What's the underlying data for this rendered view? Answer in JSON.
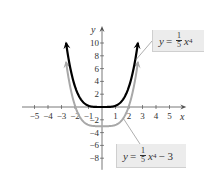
{
  "chart_data": {
    "type": "line",
    "title": "",
    "xlabel": "x",
    "ylabel": "y",
    "xlim": [
      -5.5,
      5.8
    ],
    "ylim": [
      -9.5,
      12.5
    ],
    "x_ticks": [
      -5,
      -4,
      -3,
      -2,
      -1,
      1,
      2,
      3,
      4,
      5
    ],
    "y_ticks": [
      -8,
      -6,
      -4,
      -2,
      2,
      4,
      6,
      8,
      10
    ],
    "x_tick_labels": [
      "−5",
      "−4",
      "−3",
      "−2",
      "−1",
      "1",
      "2",
      "3",
      "4",
      "5"
    ],
    "y_tick_labels": [
      "−8",
      "−6",
      "−4",
      "−2",
      "2",
      "4",
      "6",
      "8",
      "10"
    ],
    "grid": false,
    "series": [
      {
        "name": "y = (1/5)x^4",
        "formula": "0.2*x^4",
        "color": "#000000",
        "x_range": [
          -2.66,
          2.66
        ],
        "endpoints_arrow": true
      },
      {
        "name": "y = (1/5)x^4 − 3",
        "formula": "0.2*x^4 - 3",
        "color": "#a8a8a8",
        "x_range": [
          -2.66,
          2.66
        ],
        "endpoints_arrow": true
      }
    ],
    "annotations": [
      {
        "text": "y = 1/5 x^4",
        "target_series": 0
      },
      {
        "text": "y = 1/5 x^4 − 3",
        "target_series": 1
      }
    ]
  },
  "labels": {
    "top": {
      "y": "y",
      "eq": "=",
      "num": "1",
      "den": "5",
      "x": "x",
      "exp": "4",
      "tail": ""
    },
    "bottom": {
      "y": "y",
      "eq": "=",
      "num": "1",
      "den": "5",
      "x": "x",
      "exp": "4",
      "tail": "− 3"
    }
  },
  "axis_letters": {
    "x": "x",
    "y": "y"
  }
}
